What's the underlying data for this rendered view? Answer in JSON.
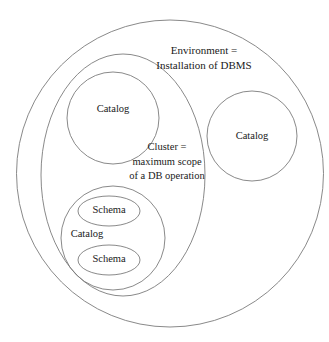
{
  "diagram": {
    "type": "nested-venn",
    "stroke_color": "#7c7c7c",
    "text_color": "#1a1a1a",
    "background_color": "#ffffff",
    "environment": {
      "name": "environment-circle",
      "label_line1": "Environment =",
      "label_line2": "Installation of DBMS"
    },
    "cluster": {
      "name": "cluster-ellipse",
      "label_line1": "Cluster =",
      "label_line2": "maximum scope",
      "label_line3": "of a DB operation"
    },
    "catalogs": [
      {
        "name": "catalog-top-left",
        "label": "Catalog"
      },
      {
        "name": "catalog-right",
        "label": "Catalog"
      },
      {
        "name": "catalog-bottom-left",
        "label": "Catalog"
      }
    ],
    "schemas": [
      {
        "name": "schema-upper",
        "label": "Schema"
      },
      {
        "name": "schema-lower",
        "label": "Schema"
      }
    ]
  }
}
